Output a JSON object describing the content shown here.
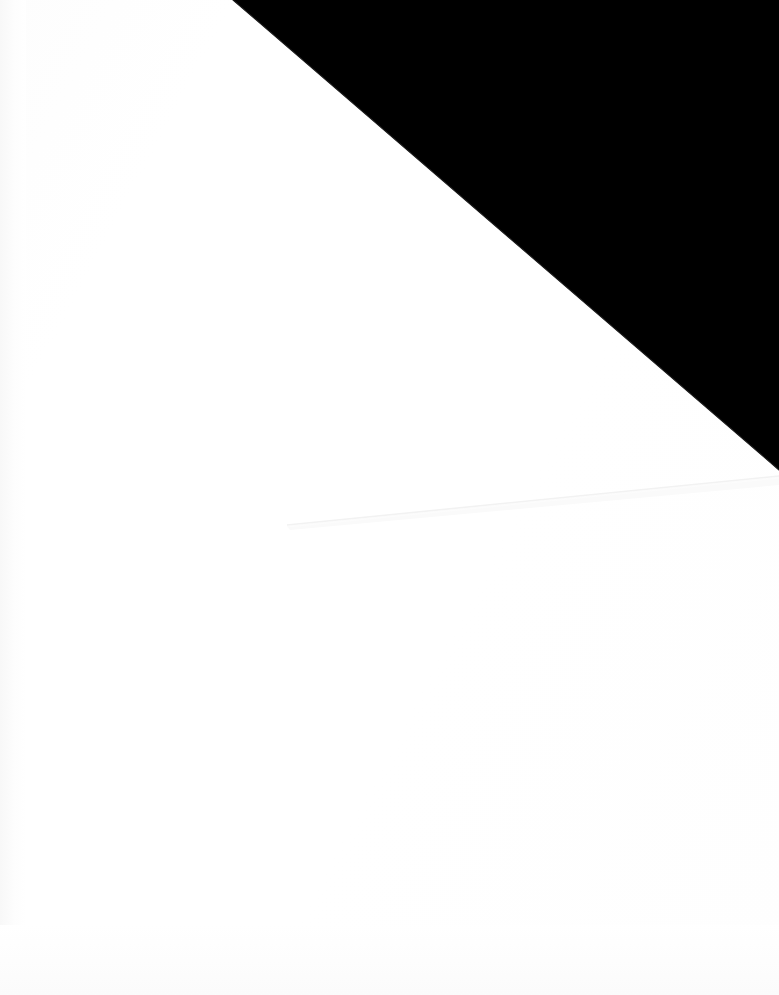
{
  "scene": {
    "kind": "scanned-page-photo",
    "width": 995,
    "caption": ""
  },
  "canvas": {
    "width_px": 779,
    "height_px": 995,
    "background_color": "#ffffff"
  },
  "regions": [
    {
      "id": "page-surface",
      "label": "White page surface",
      "color": "#ffffff",
      "description": "Blank white paper filling the frame"
    },
    {
      "id": "dark-corner",
      "label": "Black triangular corner",
      "color": "#000000",
      "description": "Solid black wedge occupying the upper-right corner of the frame",
      "vertices": [
        [
          233,
          0
        ],
        [
          779,
          0
        ],
        [
          779,
          470
        ]
      ]
    },
    {
      "id": "fold-line",
      "label": "Faint fold crease",
      "color": "#f2f2f2",
      "description": "Very light diagonal crease line across the lower-middle of the page",
      "from": [
        287,
        525
      ],
      "to": [
        779,
        476
      ]
    },
    {
      "id": "page-edge-shadow",
      "label": "Left edge paper shading",
      "color": "#f8f8f8",
      "description": "Subtle vertical tonal gradient along the left margin"
    }
  ],
  "text_content": {
    "visible_text": "",
    "note": ""
  }
}
